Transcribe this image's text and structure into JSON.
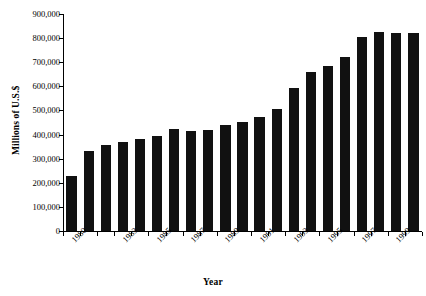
{
  "chart_data": {
    "type": "bar",
    "title": "",
    "subtitle": "",
    "xlabel": "Year",
    "ylabel": "Millions of U.S.$",
    "categories": [
      "1980",
      "1981",
      "1982",
      "1983",
      "1984",
      "1985",
      "1986",
      "1987",
      "1988",
      "1989",
      "1990",
      "1991",
      "1992",
      "1993",
      "1994",
      "1995",
      "1996",
      "1997",
      "1998",
      "1999",
      "2000"
    ],
    "values": [
      228000,
      330000,
      355000,
      370000,
      382000,
      396000,
      424000,
      416000,
      420000,
      438000,
      453000,
      473000,
      505000,
      595000,
      660000,
      684000,
      721000,
      806000,
      824000,
      820000,
      820000
    ],
    "ylim": [
      0,
      900000
    ],
    "ytick_labels": [
      "900,000",
      "800,000",
      "700,000",
      "600,000",
      "500,000",
      "400,000",
      "300,000",
      "200,000",
      "100,000",
      "0"
    ],
    "ytick_values": [
      900000,
      800000,
      700000,
      600000,
      500000,
      400000,
      300000,
      200000,
      100000,
      0
    ],
    "xtick_labels": [
      "1980",
      "1983",
      "1985",
      "1987",
      "1989",
      "1991",
      "1993",
      "1995",
      "1997",
      "1999"
    ],
    "xtick_categories": [
      "1980",
      "1983",
      "1985",
      "1987",
      "1989",
      "1991",
      "1993",
      "1995",
      "1997",
      "1999"
    ],
    "grid": false,
    "legend": false,
    "legend_position": "none",
    "bar_color": "#111111",
    "axis_color": "#000000",
    "background_color": "#ffffff"
  }
}
